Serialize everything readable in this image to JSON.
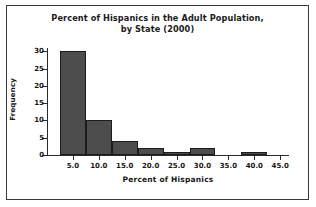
{
  "chart_data": {
    "type": "bar",
    "title": "Percent of Hispanics in the Adult Population, by State (2000)",
    "title_line1": "Percent of Hispanics in the Adult Population,",
    "title_line2": "by State (2000)",
    "xlabel": "Percent of Hispanics",
    "ylabel": "Frequency",
    "xlim": [
      0.0,
      46.5
    ],
    "ylim": [
      0,
      31
    ],
    "grid": false,
    "legend": false,
    "bin_width": 5.0,
    "bar_color": "#4d4d4d",
    "bar_edge_color": "#1c1c1c",
    "xticks": [
      5.0,
      10.0,
      15.0,
      20.0,
      25.0,
      30.0,
      35.0,
      40.0,
      45.0
    ],
    "xtick_labels": [
      "5.0",
      "10.0",
      "15.0",
      "20.0",
      "25.0",
      "30.0",
      "35.0",
      "40.0",
      "45.0"
    ],
    "yticks": [
      0,
      5,
      10,
      15,
      20,
      25,
      30
    ],
    "ytick_labels": [
      "0",
      "5",
      "10",
      "15",
      "20",
      "25",
      "30"
    ],
    "bins": [
      {
        "start": 2.5,
        "end": 7.5,
        "value": 30
      },
      {
        "start": 7.5,
        "end": 12.5,
        "value": 10
      },
      {
        "start": 12.5,
        "end": 17.5,
        "value": 4
      },
      {
        "start": 17.5,
        "end": 22.5,
        "value": 2
      },
      {
        "start": 22.5,
        "end": 27.5,
        "value": 1
      },
      {
        "start": 27.5,
        "end": 32.5,
        "value": 2
      },
      {
        "start": 37.5,
        "end": 42.5,
        "value": 1
      }
    ],
    "categories": [
      "2.5-7.5",
      "7.5-12.5",
      "12.5-17.5",
      "17.5-22.5",
      "22.5-27.5",
      "27.5-32.5",
      "37.5-42.5"
    ],
    "values": [
      30,
      10,
      4,
      2,
      1,
      2,
      1
    ]
  }
}
